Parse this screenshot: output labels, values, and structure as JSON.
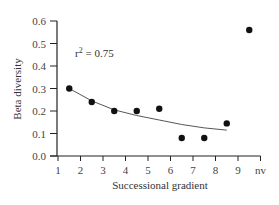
{
  "chart_data": {
    "type": "scatter",
    "title": "",
    "xlabel": "Successional gradient",
    "ylabel": "Beta diversity",
    "xlim": [
      1,
      10
    ],
    "ylim": [
      0.0,
      0.6
    ],
    "x_tick_labels": [
      "1",
      "2",
      "3",
      "4",
      "5",
      "6",
      "7",
      "8",
      "9",
      "nv"
    ],
    "y_tick_labels": [
      "0.0",
      "0.1",
      "0.2",
      "0.3",
      "0.4",
      "0.5",
      "0.6"
    ],
    "grid": false,
    "legend": null,
    "annotation": "r² = 0.75",
    "series": [
      {
        "name": "Beta diversity",
        "x": [
          1.5,
          2.5,
          3.5,
          4.5,
          5.5,
          6.5,
          7.5,
          8.5,
          9.5
        ],
        "values": [
          0.3,
          0.24,
          0.2,
          0.2,
          0.21,
          0.08,
          0.08,
          0.145,
          0.56
        ]
      },
      {
        "name": "Fitted trend",
        "type": "line",
        "x": [
          1.5,
          2.5,
          3.5,
          4.5,
          5.5,
          6.5,
          7.5,
          8.5
        ],
        "values": [
          0.3,
          0.245,
          0.205,
          0.18,
          0.16,
          0.14,
          0.125,
          0.115
        ]
      }
    ]
  },
  "labels": {
    "xlabel": "Successional gradient",
    "ylabel": "Beta diversity",
    "annotation_r": "r",
    "annotation_sup": "2",
    "annotation_val": " = 0.75"
  }
}
